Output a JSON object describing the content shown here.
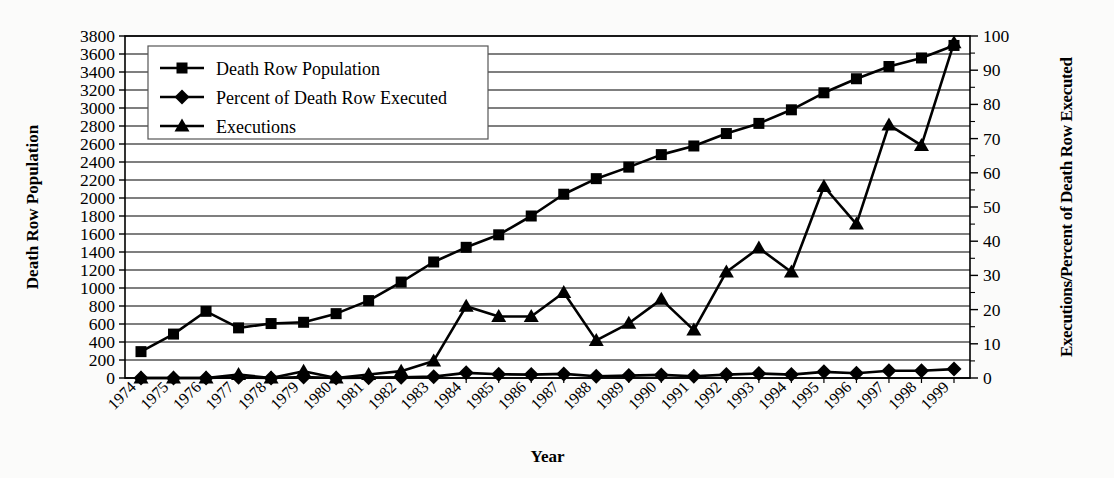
{
  "chart_data": {
    "type": "line",
    "title": "",
    "xlabel": "Year",
    "ylabel": "Death Row Population",
    "y2label": "Executions/Percent of Death Row Executed",
    "grid": true,
    "legend_position": "top-left-inside",
    "x": [
      1974,
      1975,
      1976,
      1977,
      1978,
      1979,
      1980,
      1981,
      1982,
      1983,
      1984,
      1985,
      1986,
      1987,
      1988,
      1989,
      1990,
      1991,
      1992,
      1993,
      1994,
      1995,
      1996,
      1997,
      1998,
      1999
    ],
    "categories": [
      "1974",
      "1975",
      "1976",
      "1977",
      "1978",
      "1979",
      "1980",
      "1981",
      "1982",
      "1983",
      "1984",
      "1985",
      "1986",
      "1987",
      "1988",
      "1989",
      "1990",
      "1991",
      "1992",
      "1993",
      "1994",
      "1995",
      "1996",
      "1997",
      "1998",
      "1999"
    ],
    "ylim": [
      0,
      3800
    ],
    "ytick_step": 200,
    "yticks": [
      0,
      200,
      400,
      600,
      800,
      1000,
      1200,
      1400,
      1600,
      1800,
      2000,
      2200,
      2400,
      2600,
      2800,
      3000,
      3200,
      3400,
      3600,
      3800
    ],
    "ytick_labels": [
      "0",
      "200",
      "400",
      "600",
      "800",
      "1000",
      "1200",
      "1400",
      "1600",
      "1800",
      "2000",
      "2200",
      "2400",
      "2600",
      "2800",
      "3000",
      "3200",
      "3400",
      "3600",
      "3800"
    ],
    "y2lim": [
      0,
      100
    ],
    "y2tick_step": 10,
    "y2ticks": [
      0,
      10,
      20,
      30,
      40,
      50,
      60,
      70,
      80,
      90,
      100
    ],
    "y2tick_labels": [
      "0",
      "10",
      "20",
      "30",
      "40",
      "50",
      "60",
      "70",
      "80",
      "90",
      "100"
    ],
    "series": [
      {
        "name": "Death Row Population",
        "axis": "left",
        "marker": "square",
        "values": [
          293,
          488,
          741,
          557,
          605,
          619,
          715,
          860,
          1066,
          1289,
          1452,
          1591,
          1800,
          2042,
          2215,
          2343,
          2482,
          2578,
          2716,
          2829,
          2980,
          3169,
          3325,
          3461,
          3556,
          3695
        ]
      },
      {
        "name": "Percent of Death Row Executed",
        "axis": "right",
        "marker": "diamond",
        "values": [
          0.0,
          0.0,
          0.0,
          0.2,
          0.0,
          0.3,
          0.0,
          0.1,
          0.2,
          0.4,
          1.5,
          1.1,
          1.0,
          1.2,
          0.5,
          0.7,
          0.9,
          0.5,
          1.0,
          1.3,
          1.0,
          1.8,
          1.4,
          2.1,
          2.1,
          2.6
        ]
      },
      {
        "name": "Executions",
        "axis": "right",
        "marker": "triangle",
        "values": [
          0,
          0,
          0,
          1,
          0,
          2,
          0,
          1,
          2,
          5,
          21,
          18,
          18,
          25,
          11,
          16,
          23,
          14,
          31,
          38,
          31,
          56,
          45,
          74,
          68,
          98
        ]
      }
    ],
    "legend": [
      {
        "label": "Death Row Population",
        "marker": "square"
      },
      {
        "label": "Percent of Death Row Executed",
        "marker": "diamond"
      },
      {
        "label": "Executions",
        "marker": "triangle"
      }
    ]
  }
}
